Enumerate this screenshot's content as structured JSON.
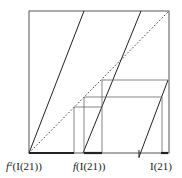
{
  "diagram": {
    "type": "cobweb-map-graph",
    "box": {
      "x1": 29,
      "y1": 11,
      "x2": 169,
      "y2": 153
    },
    "colors": {
      "frame": "#555555",
      "branch": "#222222",
      "diagonal": "#333333",
      "grid": "#666666",
      "interval": "#222222"
    },
    "labels": [
      {
        "id": "f2",
        "prefix": "f",
        "sup": "2",
        "text": "(I(21))",
        "x": 6,
        "y": 170
      },
      {
        "id": "f1",
        "prefix": "f",
        "sup": "",
        "text": "(I(21))",
        "x": 73,
        "y": 170
      },
      {
        "id": "i21",
        "prefix": "",
        "sup": "",
        "text": "I(21)",
        "x": 150,
        "y": 170
      }
    ]
  }
}
